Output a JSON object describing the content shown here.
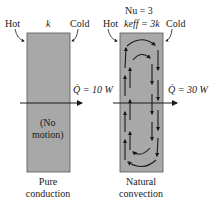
{
  "left_panel": {
    "hot_label": "Hot",
    "cold_label": "Cold",
    "conductivity_label": "k",
    "inner_text_line1": "(No",
    "inner_text_line2": "motion)",
    "heat_rate_label": "Q̇ = 10 W",
    "caption_line1": "Pure",
    "caption_line2": "conduction"
  },
  "right_panel": {
    "nusselt_label": "Nu = 3",
    "hot_label": "Hot",
    "cold_label": "Cold",
    "conductivity_label": "keff = 3k",
    "heat_rate_label": "Q̇ = 30 W",
    "caption_line1": "Natural",
    "caption_line2": "convection"
  },
  "colors": {
    "box_fill": "#a8a8a8",
    "box_stroke": "#555555",
    "arrow": "#1a1a1a"
  }
}
